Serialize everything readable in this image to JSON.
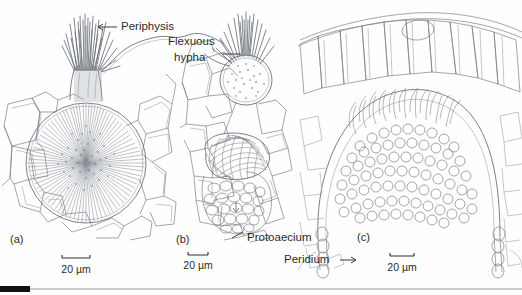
{
  "figure": {
    "background_color": "#fefefe",
    "ink_color": "#7b7f86",
    "text_color": "#2b2b2b"
  },
  "annotations": [
    {
      "id": "periphysis",
      "text": "Periphysis",
      "panel": "a"
    },
    {
      "id": "flexuous-hypha-line1",
      "text": "Flexuous",
      "panel": "b"
    },
    {
      "id": "flexuous-hypha-line2",
      "text": "hypha",
      "panel": "b"
    },
    {
      "id": "protoaecium",
      "text": "Protoaecium",
      "panel": "b"
    },
    {
      "id": "peridium",
      "text": "Peridium",
      "panel": "c"
    }
  ],
  "panels": [
    {
      "id": "a",
      "letter": "(a)",
      "subject": "spermogonium with periphyses",
      "scale": {
        "value": "20",
        "unit": "µm",
        "text": "20 µm"
      }
    },
    {
      "id": "b",
      "letter": "(b)",
      "subject": "spermogonium above protoaecium",
      "scale": {
        "value": "20",
        "unit": "µm",
        "text": "20 µm"
      }
    },
    {
      "id": "c",
      "letter": "(c)",
      "subject": "aecium with peridium",
      "scale": {
        "value": "20",
        "unit": "µm",
        "text": "20 µm"
      }
    }
  ],
  "footer_rule": {
    "dark_color": "#111111",
    "light_color": "#c9cbcd"
  }
}
